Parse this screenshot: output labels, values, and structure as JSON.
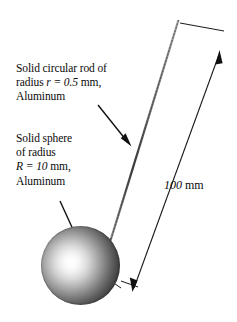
{
  "figure": {
    "background_color": "#ffffff",
    "line_color": "#1a1a1a"
  },
  "annotations": {
    "rod": {
      "line1": "Solid circular rod of",
      "line2_prefix": "radius ",
      "line2_var": "r = 0.5",
      "line2_suffix": " mm,",
      "line3": "Aluminum"
    },
    "sphere": {
      "line1": "Solid sphere",
      "line2": "of radius",
      "line3_var": "R = 10",
      "line3_suffix": " mm,",
      "line4": "Aluminum"
    },
    "length": {
      "value": "100",
      "unit": " mm"
    }
  },
  "geometry": {
    "sphere": {
      "center_x": 80,
      "center_y": 265,
      "radius": 39,
      "highlight_color": "#ffffff",
      "edge_color": "#090909"
    },
    "rod": {
      "x1": 178,
      "y1": 20,
      "x2": 108,
      "y2": 244,
      "width": 1.6,
      "color": "#555555"
    },
    "dimension_line": {
      "x1": 218,
      "y1": 53,
      "x2": 135,
      "y2": 290,
      "arrow_top": "up-right",
      "arrow_bottom": "down-left"
    }
  }
}
